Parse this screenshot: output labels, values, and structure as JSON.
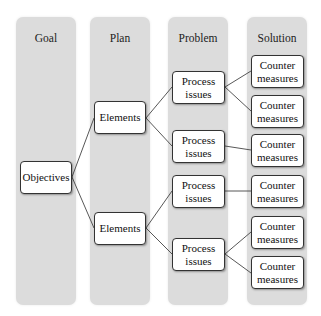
{
  "columns": [
    {
      "title": "Goal"
    },
    {
      "title": "Plan"
    },
    {
      "title": "Problem"
    },
    {
      "title": "Solution"
    }
  ],
  "nodes": {
    "goal": {
      "label": "Objectives"
    },
    "plan": [
      {
        "label": "Elements"
      },
      {
        "label": "Elements"
      }
    ],
    "problem": [
      {
        "label": "Process issues"
      },
      {
        "label": "Process issues"
      },
      {
        "label": "Process issues"
      },
      {
        "label": "Process issues"
      }
    ],
    "solution": [
      {
        "label": "Counter measures"
      },
      {
        "label": "Counter measures"
      },
      {
        "label": "Counter measures"
      },
      {
        "label": "Counter measures"
      },
      {
        "label": "Counter measures"
      },
      {
        "label": "Counter measures"
      }
    ]
  },
  "colors": {
    "column_bg": "#dcdcdc",
    "box_border": "#333333",
    "line": "#444444"
  }
}
